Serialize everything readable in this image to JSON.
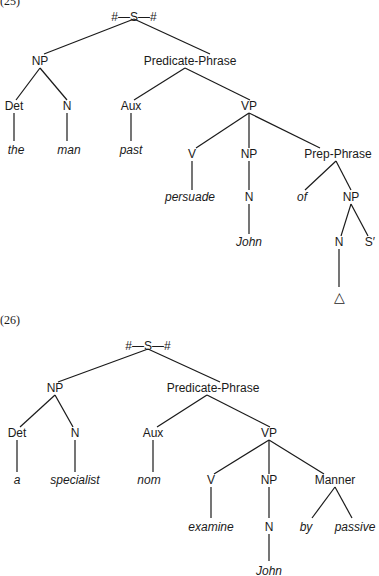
{
  "trees": [
    {
      "label": "(25)",
      "nodes": [
        {
          "id": "S",
          "text": "#—S—#",
          "x": 134,
          "y": 10
        },
        {
          "id": "NP1",
          "text": "NP",
          "x": 40,
          "y": 54
        },
        {
          "id": "PredP",
          "text": "Predicate-Phrase",
          "x": 190,
          "y": 54
        },
        {
          "id": "Det",
          "text": "Det",
          "x": 14,
          "y": 99
        },
        {
          "id": "N1",
          "text": "N",
          "x": 67,
          "y": 99
        },
        {
          "id": "Aux",
          "text": "Aux",
          "x": 131,
          "y": 99
        },
        {
          "id": "VP",
          "text": "VP",
          "x": 249,
          "y": 99
        },
        {
          "id": "the",
          "text": "the",
          "x": 16,
          "y": 143,
          "leaf": true
        },
        {
          "id": "man",
          "text": "man",
          "x": 69,
          "y": 143,
          "leaf": true
        },
        {
          "id": "past",
          "text": "past",
          "x": 131,
          "y": 143,
          "leaf": true
        },
        {
          "id": "V",
          "text": "V",
          "x": 192,
          "y": 147
        },
        {
          "id": "NP2",
          "text": "NP",
          "x": 249,
          "y": 147
        },
        {
          "id": "PrepP",
          "text": "Prep-Phrase",
          "x": 338,
          "y": 147
        },
        {
          "id": "persuade",
          "text": "persuade",
          "x": 190,
          "y": 190,
          "leaf": true
        },
        {
          "id": "N2",
          "text": "N",
          "x": 249,
          "y": 190
        },
        {
          "id": "of",
          "text": "of",
          "x": 302,
          "y": 190,
          "leaf": true
        },
        {
          "id": "NP3",
          "text": "NP",
          "x": 351,
          "y": 190
        },
        {
          "id": "John1",
          "text": "John",
          "x": 249,
          "y": 235,
          "leaf": true
        },
        {
          "id": "N3",
          "text": "N",
          "x": 339,
          "y": 235
        },
        {
          "id": "Sprime",
          "text": "S′",
          "x": 370,
          "y": 235
        },
        {
          "id": "delta",
          "text": "△",
          "x": 339,
          "y": 290
        }
      ]
    },
    {
      "label": "(26)",
      "nodes": [
        {
          "id": "S",
          "text": "#—S—#",
          "x": 148,
          "y": 339
        },
        {
          "id": "NP1",
          "text": "NP",
          "x": 55,
          "y": 381
        },
        {
          "id": "PredP",
          "text": "Predicate-Phrase",
          "x": 213,
          "y": 381
        },
        {
          "id": "Det",
          "text": "Det",
          "x": 17,
          "y": 426
        },
        {
          "id": "N1",
          "text": "N",
          "x": 75,
          "y": 426
        },
        {
          "id": "Aux",
          "text": "Aux",
          "x": 153,
          "y": 426
        },
        {
          "id": "VP",
          "text": "VP",
          "x": 269,
          "y": 426
        },
        {
          "id": "a",
          "text": "a",
          "x": 17,
          "y": 473,
          "leaf": true
        },
        {
          "id": "specialist",
          "text": "specialist",
          "x": 75,
          "y": 473,
          "leaf": true
        },
        {
          "id": "nom",
          "text": "nom",
          "x": 149,
          "y": 473,
          "leaf": true
        },
        {
          "id": "V",
          "text": "V",
          "x": 211,
          "y": 473
        },
        {
          "id": "NP2",
          "text": "NP",
          "x": 269,
          "y": 473
        },
        {
          "id": "Manner",
          "text": "Manner",
          "x": 335,
          "y": 473
        },
        {
          "id": "examine",
          "text": "examine",
          "x": 211,
          "y": 520,
          "leaf": true
        },
        {
          "id": "N2",
          "text": "N",
          "x": 269,
          "y": 520
        },
        {
          "id": "by",
          "text": "by",
          "x": 306,
          "y": 520,
          "leaf": true
        },
        {
          "id": "passive",
          "text": "passive",
          "x": 355,
          "y": 520,
          "leaf": true
        },
        {
          "id": "John",
          "text": "John",
          "x": 269,
          "y": 564,
          "leaf": true
        }
      ]
    }
  ],
  "edges": [
    [
      134,
      19,
      44,
      54
    ],
    [
      134,
      19,
      210,
      54
    ],
    [
      40,
      68,
      16,
      100
    ],
    [
      40,
      68,
      67,
      100
    ],
    [
      185,
      68,
      134,
      100
    ],
    [
      185,
      68,
      250,
      100
    ],
    [
      14,
      113,
      14,
      141
    ],
    [
      67,
      113,
      67,
      141
    ],
    [
      131,
      113,
      131,
      141
    ],
    [
      249,
      113,
      196,
      148
    ],
    [
      249,
      113,
      249,
      148
    ],
    [
      249,
      113,
      320,
      148
    ],
    [
      192,
      161,
      192,
      190
    ],
    [
      249,
      161,
      249,
      190
    ],
    [
      336,
      161,
      305,
      190
    ],
    [
      336,
      161,
      351,
      190
    ],
    [
      249,
      204,
      249,
      234
    ],
    [
      351,
      204,
      341,
      236
    ],
    [
      351,
      204,
      368,
      236
    ],
    [
      339,
      249,
      339,
      287
    ],
    [
      148,
      349,
      58,
      382
    ],
    [
      148,
      349,
      220,
      382
    ],
    [
      55,
      395,
      20,
      427
    ],
    [
      55,
      395,
      73,
      427
    ],
    [
      207,
      395,
      157,
      427
    ],
    [
      207,
      395,
      270,
      427
    ],
    [
      17,
      440,
      17,
      472
    ],
    [
      75,
      440,
      75,
      472
    ],
    [
      153,
      440,
      153,
      472
    ],
    [
      269,
      440,
      214,
      474
    ],
    [
      269,
      440,
      269,
      474
    ],
    [
      269,
      440,
      324,
      474
    ],
    [
      211,
      487,
      211,
      518
    ],
    [
      269,
      487,
      269,
      518
    ],
    [
      335,
      487,
      312,
      518
    ],
    [
      335,
      487,
      352,
      518
    ],
    [
      269,
      534,
      269,
      561
    ]
  ]
}
